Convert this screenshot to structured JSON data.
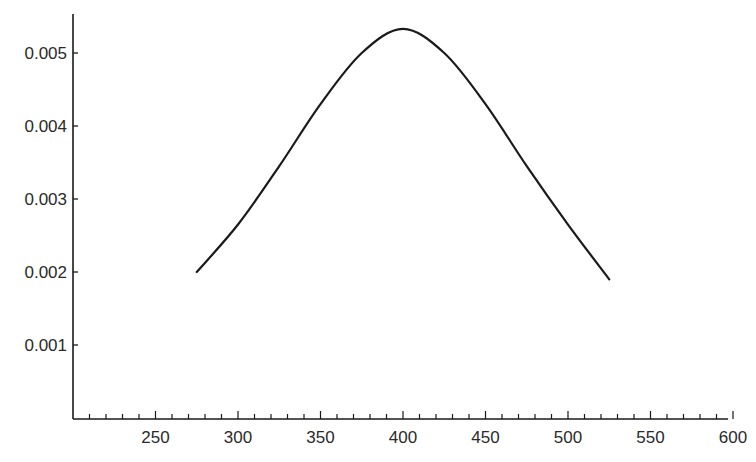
{
  "chart_data": {
    "type": "line",
    "title": "",
    "xlabel": "",
    "ylabel": "",
    "xlim": [
      200,
      600
    ],
    "ylim": [
      0,
      0.0055
    ],
    "grid": false,
    "legend": null,
    "x_ticks": [
      250,
      300,
      350,
      400,
      450,
      500,
      550,
      600
    ],
    "x_tick_labels": [
      "250",
      "300",
      "350",
      "400",
      "450",
      "500",
      "550",
      "600"
    ],
    "x_minor_tick_step": 10,
    "y_ticks": [
      0.001,
      0.002,
      0.003,
      0.004,
      0.005
    ],
    "y_tick_labels": [
      "0.001",
      "0.002",
      "0.003",
      "0.004",
      "0.005"
    ],
    "series": [
      {
        "name": "curve",
        "color": "#1a1a1a",
        "x": [
          275,
          300,
          325,
          350,
          375,
          400,
          425,
          450,
          475,
          500,
          525
        ],
        "y": [
          0.002,
          0.00265,
          0.00345,
          0.0043,
          0.005,
          0.00533,
          0.005,
          0.0043,
          0.00345,
          0.00265,
          0.0019
        ]
      }
    ]
  },
  "style": {
    "axis_color": "#1a1a1a",
    "line_color": "#1a1a1a",
    "background": "#ffffff"
  }
}
